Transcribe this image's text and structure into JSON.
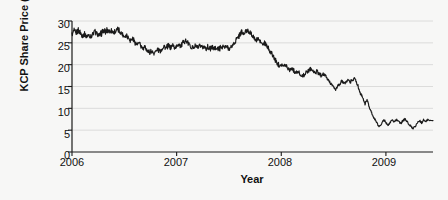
{
  "chart_data": {
    "type": "line",
    "title": "",
    "xlabel": "Year",
    "ylabel": "KCP Share Price ($)",
    "xlim": [
      2006.0,
      2009.45
    ],
    "ylim": [
      0,
      30
    ],
    "yticks": [
      0,
      5,
      10,
      15,
      20,
      25,
      30
    ],
    "ytick_labels": [
      "0",
      "5",
      "10",
      "15",
      "20",
      "25",
      "30"
    ],
    "xticks": [
      2006,
      2007,
      2008,
      2009
    ],
    "xtick_labels": [
      "2006",
      "2007",
      "2008",
      "2009"
    ],
    "grid": "horizontal",
    "legend": "none",
    "series": [
      {
        "name": "KCP Share Price",
        "color": "#1a1a1a",
        "x": [
          2006.0,
          2006.02,
          2006.04,
          2006.06,
          2006.08,
          2006.1,
          2006.12,
          2006.14,
          2006.16,
          2006.18,
          2006.2,
          2006.22,
          2006.24,
          2006.26,
          2006.28,
          2006.3,
          2006.32,
          2006.34,
          2006.36,
          2006.38,
          2006.4,
          2006.42,
          2006.44,
          2006.46,
          2006.48,
          2006.5,
          2006.52,
          2006.54,
          2006.56,
          2006.58,
          2006.6,
          2006.62,
          2006.64,
          2006.66,
          2006.68,
          2006.7,
          2006.72,
          2006.74,
          2006.76,
          2006.78,
          2006.8,
          2006.82,
          2006.84,
          2006.86,
          2006.88,
          2006.9,
          2006.92,
          2006.94,
          2006.96,
          2006.98,
          2007.0,
          2007.02,
          2007.04,
          2007.06,
          2007.08,
          2007.1,
          2007.12,
          2007.14,
          2007.16,
          2007.18,
          2007.2,
          2007.22,
          2007.24,
          2007.26,
          2007.28,
          2007.3,
          2007.32,
          2007.34,
          2007.36,
          2007.38,
          2007.4,
          2007.42,
          2007.44,
          2007.46,
          2007.48,
          2007.5,
          2007.52,
          2007.54,
          2007.56,
          2007.58,
          2007.6,
          2007.62,
          2007.64,
          2007.66,
          2007.68,
          2007.7,
          2007.72,
          2007.74,
          2007.76,
          2007.78,
          2007.8,
          2007.82,
          2007.84,
          2007.86,
          2007.88,
          2007.9,
          2007.92,
          2007.94,
          2007.96,
          2007.98,
          2008.0,
          2008.02,
          2008.04,
          2008.06,
          2008.08,
          2008.1,
          2008.12,
          2008.14,
          2008.16,
          2008.18,
          2008.2,
          2008.22,
          2008.24,
          2008.26,
          2008.28,
          2008.3,
          2008.32,
          2008.34,
          2008.36,
          2008.38,
          2008.4,
          2008.42,
          2008.44,
          2008.46,
          2008.48,
          2008.5,
          2008.52,
          2008.54,
          2008.56,
          2008.58,
          2008.6,
          2008.62,
          2008.64,
          2008.66,
          2008.68,
          2008.7,
          2008.72,
          2008.74,
          2008.76,
          2008.78,
          2008.8,
          2008.82,
          2008.84,
          2008.86,
          2008.88,
          2008.9,
          2008.92,
          2008.94,
          2008.96,
          2008.98,
          2009.0,
          2009.02,
          2009.04,
          2009.06,
          2009.08,
          2009.1,
          2009.12,
          2009.14,
          2009.16,
          2009.18,
          2009.2,
          2009.22,
          2009.24,
          2009.26,
          2009.28,
          2009.3,
          2009.32,
          2009.34,
          2009.36,
          2009.38,
          2009.4,
          2009.45
        ],
        "y": [
          26.8,
          27.6,
          27.2,
          27.9,
          27.3,
          26.6,
          27.1,
          26.4,
          26.9,
          26.3,
          27.0,
          27.6,
          27.1,
          26.6,
          27.2,
          27.8,
          27.4,
          28.0,
          27.6,
          27.9,
          27.3,
          27.7,
          28.1,
          27.5,
          27.0,
          26.4,
          26.8,
          26.2,
          25.6,
          25.9,
          25.2,
          24.6,
          24.9,
          24.2,
          23.6,
          23.9,
          23.3,
          22.8,
          23.2,
          22.6,
          23.0,
          23.6,
          23.1,
          23.7,
          24.3,
          23.8,
          24.4,
          23.9,
          24.5,
          23.8,
          24.2,
          24.8,
          24.3,
          25.0,
          25.6,
          25.1,
          24.6,
          24.1,
          23.9,
          24.3,
          23.9,
          24.2,
          23.8,
          24.1,
          23.8,
          24.0,
          23.7,
          24.0,
          23.7,
          23.9,
          23.6,
          23.9,
          24.2,
          23.8,
          24.1,
          23.7,
          24.0,
          24.6,
          25.3,
          26.0,
          26.8,
          27.4,
          26.9,
          27.6,
          28.0,
          27.4,
          26.8,
          26.1,
          25.5,
          25.9,
          25.2,
          24.6,
          24.9,
          24.2,
          23.6,
          22.8,
          22.0,
          21.2,
          20.4,
          19.8,
          20.2,
          19.6,
          20.0,
          19.4,
          18.8,
          19.2,
          18.6,
          18.0,
          18.4,
          17.8,
          17.3,
          17.7,
          18.2,
          18.7,
          19.2,
          18.6,
          18.1,
          18.5,
          18.0,
          17.5,
          17.9,
          17.4,
          16.8,
          16.2,
          15.5,
          14.8,
          14.3,
          15.0,
          15.6,
          16.2,
          15.6,
          16.1,
          16.6,
          16.0,
          16.5,
          17.0,
          16.4,
          16.9,
          17.4,
          16.8,
          16.2,
          16.7,
          17.2,
          16.6,
          16.0,
          15.4,
          14.9,
          15.4,
          16.0,
          16.6,
          17.2,
          18.0,
          17.4,
          16.8,
          16.1,
          15.4,
          14.7,
          14.0,
          13.3,
          12.8,
          13.4,
          14.0,
          14.6,
          15.2,
          14.6,
          15.3,
          16.0,
          16.8,
          17.6,
          17.0,
          16.2,
          15.4
        ]
      }
    ],
    "series_tail": {
      "name": "KCP Share Price (late 2008 - 2009 crash and recovery)",
      "x": [
        2008.72,
        2008.74,
        2008.76,
        2008.78,
        2008.8,
        2008.82,
        2008.84,
        2008.86,
        2008.88,
        2008.9,
        2008.92,
        2008.94,
        2008.96,
        2008.98,
        2009.0,
        2009.02,
        2009.04,
        2009.06,
        2009.08,
        2009.1,
        2009.12,
        2009.14,
        2009.16,
        2009.18,
        2009.2,
        2009.22,
        2009.24,
        2009.26,
        2009.28,
        2009.3,
        2009.32,
        2009.34,
        2009.36,
        2009.38,
        2009.4,
        2009.45
      ],
      "y": [
        16.0,
        14.5,
        13.2,
        12.4,
        11.0,
        12.0,
        10.4,
        9.2,
        8.0,
        7.2,
        6.4,
        5.8,
        6.6,
        7.4,
        6.8,
        6.2,
        6.8,
        7.4,
        6.9,
        7.5,
        7.0,
        6.5,
        7.1,
        7.6,
        7.0,
        6.4,
        5.8,
        5.4,
        6.0,
        6.6,
        7.2,
        6.7,
        7.3,
        6.9,
        7.4,
        7.2
      ]
    },
    "annotations": [],
    "notes": {
      "start_value": 26.8,
      "peak_value": 28.1,
      "end_value": 7.2,
      "min_value": 5.4
    }
  },
  "axes": {
    "ylabel": "KCP Share Price ($)",
    "xlabel": "Year"
  }
}
